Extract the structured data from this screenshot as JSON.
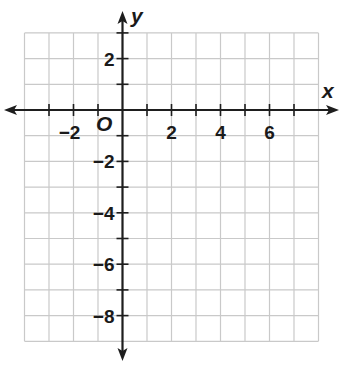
{
  "chart_data": {
    "type": "coordinate-grid",
    "title": "",
    "xlabel": "x",
    "ylabel": "y",
    "origin_label": "O",
    "grid": true,
    "xlim": [
      -4,
      8
    ],
    "ylim": [
      -9,
      3
    ],
    "x_ticks": [
      -3,
      -2,
      -1,
      1,
      2,
      3,
      4,
      5,
      6,
      7
    ],
    "y_ticks": [
      3,
      2,
      1,
      -1,
      -2,
      -3,
      -4,
      -5,
      -6,
      -7,
      -8
    ],
    "x_tick_labels": [
      {
        "value": -2,
        "text": "−2"
      },
      {
        "value": 2,
        "text": "2"
      },
      {
        "value": 4,
        "text": "4"
      },
      {
        "value": 6,
        "text": "6"
      }
    ],
    "y_tick_labels": [
      {
        "value": 2,
        "text": "2"
      },
      {
        "value": -2,
        "text": "−2"
      },
      {
        "value": -4,
        "text": "−4"
      },
      {
        "value": -6,
        "text": "−6"
      },
      {
        "value": -8,
        "text": "−8"
      }
    ],
    "series": []
  },
  "style": {
    "grid_color": "#c9c9c9",
    "axis_color": "#1e1e1e"
  }
}
